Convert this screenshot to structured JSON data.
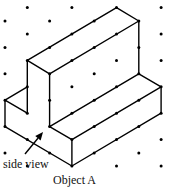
{
  "figure": {
    "caption": "Object A",
    "annotation": "side view",
    "colors": {
      "line": "#000000",
      "dot": "#000000",
      "background": "#ffffff"
    },
    "grid": {
      "type": "isometric-dot",
      "columns_x": [
        5,
        27.3,
        49.6,
        71.9,
        94.2,
        116.5,
        138.8,
        161.1
      ],
      "even_rows_y": [
        21,
        47.4,
        73.8,
        100.2,
        126.6,
        153
      ],
      "odd_rows_y": [
        7.6,
        34,
        60.4,
        86.8,
        113.2,
        139.6,
        166
      ]
    },
    "edges": [
      [
        [
          27.3,
          60.4
        ],
        [
          116.5,
          7.6
        ]
      ],
      [
        [
          116.5,
          7.6
        ],
        [
          138.8,
          21
        ]
      ],
      [
        [
          138.8,
          21
        ],
        [
          49.6,
          73.8
        ]
      ],
      [
        [
          27.3,
          60.4
        ],
        [
          49.6,
          73.8
        ]
      ],
      [
        [
          27.3,
          60.4
        ],
        [
          27.3,
          113.2
        ]
      ],
      [
        [
          49.6,
          73.8
        ],
        [
          49.6,
          126.6
        ]
      ],
      [
        [
          138.8,
          21
        ],
        [
          138.8,
          73.8
        ]
      ],
      [
        [
          138.8,
          73.8
        ],
        [
          161.1,
          86.8
        ]
      ],
      [
        [
          49.6,
          126.6
        ],
        [
          138.8,
          73.8
        ]
      ],
      [
        [
          49.6,
          126.6
        ],
        [
          71.9,
          139.6
        ]
      ],
      [
        [
          71.9,
          139.6
        ],
        [
          161.1,
          86.8
        ]
      ],
      [
        [
          161.1,
          86.8
        ],
        [
          161.1,
          113.2
        ]
      ],
      [
        [
          71.9,
          166
        ],
        [
          161.1,
          113.2
        ]
      ],
      [
        [
          71.9,
          139.6
        ],
        [
          71.9,
          166
        ]
      ],
      [
        [
          5,
          126.6
        ],
        [
          71.9,
          166
        ]
      ],
      [
        [
          5,
          100.2
        ],
        [
          5,
          126.6
        ]
      ],
      [
        [
          5,
          100.2
        ],
        [
          27.3,
          86.8
        ]
      ],
      [
        [
          5,
          100.2
        ],
        [
          27.3,
          113.2
        ]
      ]
    ],
    "arrow": {
      "from": [
        25,
        154
      ],
      "to": [
        43,
        132
      ]
    }
  }
}
